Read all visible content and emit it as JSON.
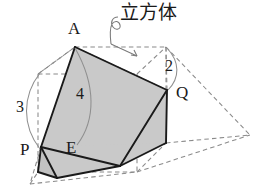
{
  "figure": {
    "title_annotation": "立方体",
    "colors": {
      "fill_shaded": "#c9c9c9",
      "stroke_solid": "#1a1a1a",
      "stroke_dashed": "#8a8a8a",
      "leader": "#7a7a7a",
      "background": "#ffffff",
      "text": "#1a1a1a"
    },
    "vertex_labels": [
      {
        "name": "A",
        "text": "A",
        "x": 68,
        "y": 20
      },
      {
        "name": "Q",
        "text": "Q",
        "x": 176,
        "y": 84
      },
      {
        "name": "P",
        "text": "P",
        "x": 20,
        "y": 141
      },
      {
        "name": "E",
        "text": "E",
        "x": 66,
        "y": 139
      }
    ],
    "measure_labels": [
      {
        "name": "edge-length-3",
        "text": "3",
        "x": 16,
        "y": 99
      },
      {
        "name": "edge-length-4",
        "text": "4",
        "x": 76,
        "y": 86
      },
      {
        "name": "edge-length-2",
        "text": "2",
        "x": 165,
        "y": 58
      }
    ],
    "callout": {
      "text": "立方体",
      "x": 120,
      "y": 3
    },
    "geometry": {
      "cube_front_top_left": [
        38,
        74
      ],
      "cube_front_top_right": [
        137,
        74
      ],
      "cube_front_bottom_left": [
        38,
        172
      ],
      "cube_front_bottom_right": [
        137,
        172
      ],
      "cube_back_top_left": [
        75,
        47
      ],
      "cube_back_top_right": [
        166,
        47
      ],
      "cube_back_bottom_left": [
        75,
        143
      ],
      "cube_back_bottom_right": [
        166,
        143
      ],
      "point_A": [
        75,
        47
      ],
      "point_Q": [
        167,
        90
      ],
      "point_P": [
        41,
        147
      ],
      "point_E": [
        75,
        143
      ],
      "far_apex": [
        250,
        135
      ],
      "section_polygon": [
        [
          75,
          47
        ],
        [
          167,
          90
        ],
        [
          166,
          143
        ],
        [
          120,
          166
        ],
        [
          57,
          178
        ],
        [
          41,
          147
        ]
      ]
    }
  }
}
